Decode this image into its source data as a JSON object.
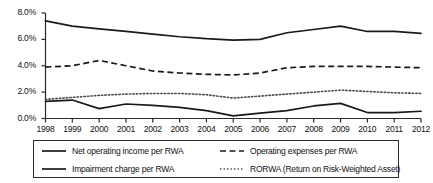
{
  "chart_data": {
    "type": "line",
    "title": "",
    "xlabel": "",
    "ylabel": "",
    "x": [
      1998,
      1999,
      2000,
      2001,
      2002,
      2003,
      2004,
      2005,
      2006,
      2007,
      2008,
      2009,
      2010,
      2011,
      2012
    ],
    "categories": [
      "1998",
      "1999",
      "2000",
      "2001",
      "2002",
      "2003",
      "2004",
      "2005",
      "2006",
      "2007",
      "2008",
      "2009",
      "2010",
      "2011",
      "2012"
    ],
    "xlim": [
      1998,
      2012
    ],
    "ylim": [
      0.0,
      8.0
    ],
    "yticks": [
      0.0,
      2.0,
      4.0,
      6.0,
      8.0
    ],
    "ytick_labels": [
      "0.0%",
      "2.0%",
      "4.0%",
      "6.0%",
      "8.0%"
    ],
    "grid": false,
    "legend_position": "bottom",
    "series": [
      {
        "name": "Net operating income per RWA",
        "style": "solid",
        "color": "#1a1a1a",
        "values": [
          7.4,
          7.0,
          6.8,
          6.6,
          6.4,
          6.2,
          6.05,
          5.95,
          6.0,
          6.5,
          6.75,
          7.0,
          6.6,
          6.6,
          6.45
        ]
      },
      {
        "name": "Operating expenses per RWA",
        "style": "dashed",
        "color": "#1a1a1a",
        "values": [
          3.9,
          4.0,
          4.4,
          4.0,
          3.6,
          3.45,
          3.35,
          3.3,
          3.45,
          3.85,
          3.95,
          3.95,
          3.95,
          3.9,
          3.85
        ]
      },
      {
        "name": "Impairment charge per RWA",
        "style": "solid",
        "color": "#1a1a1a",
        "values": [
          1.3,
          1.4,
          0.75,
          1.1,
          1.0,
          0.85,
          0.6,
          0.2,
          0.4,
          0.6,
          0.95,
          1.15,
          0.45,
          0.45,
          0.55
        ]
      },
      {
        "name": "RORWA (Return on Risk-Weighted Asset)",
        "style": "dotted",
        "color": "#4a4a4a",
        "values": [
          1.45,
          1.6,
          1.75,
          1.85,
          1.9,
          1.9,
          1.8,
          1.55,
          1.7,
          1.85,
          2.0,
          2.15,
          2.05,
          1.95,
          1.9
        ]
      }
    ],
    "legend": [
      {
        "label": "Net operating income per RWA",
        "style": "solid"
      },
      {
        "label": "Operating expenses per RWA",
        "style": "dashed"
      },
      {
        "label": "Impairment charge per RWA",
        "style": "solid"
      },
      {
        "label": "RORWA (Return on Risk-Weighted Asset)",
        "style": "dotted"
      }
    ]
  },
  "axis": {
    "y_labels": [
      "8.0%",
      "6.0%",
      "4.0%",
      "2.0%",
      "0.0%"
    ],
    "x_labels": [
      "1998",
      "1999",
      "2000",
      "2001",
      "2002",
      "2003",
      "2004",
      "2005",
      "2006",
      "2007",
      "2008",
      "2009",
      "2010",
      "2011",
      "2012"
    ]
  },
  "legend": {
    "net_operating_income": "Net operating income per RWA",
    "operating_expenses": "Operating expenses per RWA",
    "impairment_charge": "Impairment charge per RWA",
    "rorwa": "RORWA (Return on Risk-Weighted Asset)"
  },
  "colors": {
    "line": "#1a1a1a",
    "dotted_line": "#4a4a4a",
    "axis": "#2b2b2b",
    "background": "#ffffff"
  }
}
